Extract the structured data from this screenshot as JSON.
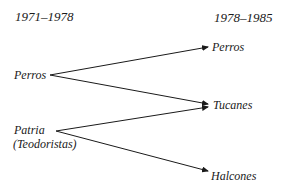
{
  "periods": {
    "left": "1971–1978",
    "right": "1978–1985"
  },
  "sources": [
    {
      "id": "perros_old",
      "label": "Perros"
    },
    {
      "id": "patria",
      "label": "Patria",
      "sublabel": "(Teodoristas)"
    }
  ],
  "targets": [
    {
      "id": "perros_new",
      "label": "Perros"
    },
    {
      "id": "tucanes",
      "label": "Tucanes"
    },
    {
      "id": "halcones",
      "label": "Halcones"
    }
  ],
  "edges": [
    {
      "from": "perros_old",
      "to": "perros_new"
    },
    {
      "from": "perros_old",
      "to": "tucanes"
    },
    {
      "from": "patria",
      "to": "tucanes"
    },
    {
      "from": "patria",
      "to": "halcones"
    }
  ],
  "colors": {
    "ink": "#1a1a1a",
    "background": "#ffffff"
  }
}
